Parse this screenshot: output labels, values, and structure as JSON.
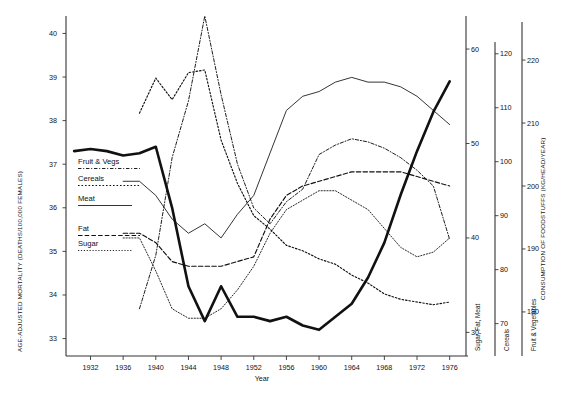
{
  "figure": {
    "left_axis_title": "AGE-ADJUSTED MORTALITY (DEATHS/100,000 FEMALES)",
    "right_axis_title": "CONSUMPTION OF FOODSTUFFS (KG/HEAD/YEAR)",
    "xlabel": "Year",
    "right_axis_names": [
      "Sugar, Fat, Meat",
      "Cereals",
      "Fruit & Vegetables"
    ]
  },
  "legend": {
    "items": [
      {
        "label": "Fruit & Vegs",
        "style": "dashdot"
      },
      {
        "label": "Cereals",
        "style": "dotted"
      },
      {
        "label": "Meat",
        "style": "solid"
      },
      {
        "label": "Fat",
        "style": "dashed"
      },
      {
        "label": "Sugar",
        "style": "finedot"
      }
    ]
  },
  "chart_data": {
    "type": "line",
    "title": "",
    "xlabel": "Year",
    "ylabel": "AGE-ADJUSTED MORTALITY (DEATHS/100,000 FEMALES)",
    "y2label": "CONSUMPTION OF FOODSTUFFS (KG/HEAD/YEAR)",
    "grid": false,
    "legend_position": "inside-left",
    "x": [
      1930,
      1932,
      1934,
      1936,
      1938,
      1940,
      1942,
      1944,
      1946,
      1948,
      1950,
      1952,
      1954,
      1956,
      1958,
      1960,
      1962,
      1964,
      1966,
      1968,
      1970,
      1972,
      1974,
      1976,
      1978
    ],
    "xlim": [
      1929,
      1978
    ],
    "xticks": [
      1932,
      1936,
      1940,
      1944,
      1948,
      1952,
      1956,
      1960,
      1964,
      1968,
      1972,
      1976
    ],
    "axes": [
      {
        "name": "mortality",
        "side": "left",
        "ticks": [
          33,
          34,
          35,
          36,
          37,
          38,
          39,
          40
        ],
        "lim": [
          32.6,
          40.4
        ]
      },
      {
        "name": "Sugar, Fat, Meat",
        "side": "right",
        "ticks": [
          30,
          40,
          50,
          60
        ],
        "lim": [
          27.5,
          63.5
        ]
      },
      {
        "name": "Cereals",
        "side": "right",
        "ticks": [
          70,
          80,
          90,
          100,
          110,
          120
        ],
        "lim": [
          64,
          127
        ]
      },
      {
        "name": "Fruit & Vegetables",
        "side": "right",
        "ticks": [
          180,
          190,
          200,
          210,
          220
        ],
        "lim": [
          173,
          227
        ]
      }
    ],
    "series": [
      {
        "name": "Age-adjusted mortality",
        "axis": "mortality",
        "style": "thick-solid",
        "values": [
          37.3,
          37.35,
          37.3,
          37.2,
          37.25,
          37.4,
          36.0,
          34.2,
          33.4,
          34.2,
          33.5,
          33.5,
          33.4,
          33.5,
          33.3,
          33.2,
          33.5,
          33.8,
          34.4,
          35.2,
          36.3,
          37.3,
          38.2,
          38.9,
          null
        ]
      },
      {
        "name": "Fruit & Vegs",
        "axis": "Fruit & Vegetables",
        "style": "dashdot",
        "values": [
          null,
          null,
          null,
          null,
          180.5,
          189.0,
          204.5,
          213.5,
          227.0,
          214.5,
          203.5,
          196.5,
          194.0,
          197.5,
          199.5,
          205.0,
          206.5,
          207.5,
          207.0,
          206.0,
          204.5,
          202.5,
          200.0,
          191.5,
          null
        ]
      },
      {
        "name": "Cereals",
        "axis": "Cereals",
        "style": "dotted",
        "values": [
          null,
          null,
          null,
          null,
          109.0,
          115.5,
          111.5,
          116.5,
          117.0,
          104.0,
          96.0,
          90.0,
          87.5,
          84.5,
          83.5,
          82.0,
          81.0,
          79.0,
          77.5,
          75.5,
          74.5,
          74.0,
          73.5,
          74.0,
          null
        ]
      },
      {
        "name": "Meat",
        "axis": "Sugar, Fat, Meat",
        "style": "solid",
        "values": [
          null,
          null,
          null,
          46.0,
          46.0,
          44.5,
          42.0,
          40.5,
          41.5,
          40.0,
          42.5,
          44.5,
          49.0,
          53.5,
          55.0,
          55.5,
          56.5,
          57.0,
          56.5,
          56.5,
          56.0,
          55.0,
          53.5,
          52.0,
          null
        ]
      },
      {
        "name": "Fat",
        "axis": "Sugar, Fat, Meat",
        "style": "dashed",
        "values": [
          null,
          null,
          null,
          40.5,
          40.5,
          39.5,
          37.5,
          37.0,
          37.0,
          37.0,
          37.5,
          38.0,
          42.0,
          44.5,
          45.5,
          46.0,
          46.5,
          47.0,
          47.0,
          47.0,
          47.0,
          46.5,
          46.0,
          45.5,
          null
        ]
      },
      {
        "name": "Sugar",
        "axis": "Sugar, Fat, Meat",
        "style": "finedot",
        "values": [
          null,
          null,
          null,
          40.0,
          40.0,
          36.5,
          32.5,
          31.5,
          31.5,
          32.5,
          34.5,
          37.0,
          40.5,
          43.0,
          44.0,
          45.0,
          45.0,
          44.0,
          43.0,
          41.0,
          39.0,
          38.0,
          38.5,
          40.0,
          null
        ]
      }
    ]
  }
}
